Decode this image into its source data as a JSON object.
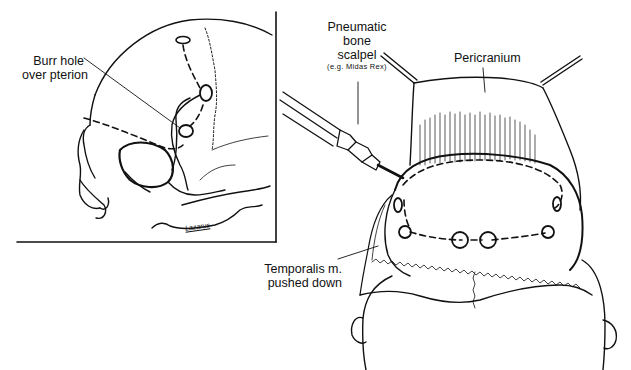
{
  "figure": {
    "left_panel": {
      "title": "Lateral skull view",
      "labels": {
        "burr_hole_line1": "Burr hole",
        "burr_hole_line2": "over pterion"
      },
      "signature": "Lazarus"
    },
    "right_panel": {
      "title": "Superior view of exposed cranium",
      "labels": {
        "scalpel_line1": "Pneumatic",
        "scalpel_line2": "bone",
        "scalpel_line3": "scalpel",
        "scalpel_example": "(e.g. Midas Rex)",
        "pericranium": "Pericranium",
        "temporalis_line1": "Temporalis m.",
        "temporalis_line2": "pushed down"
      },
      "burr_hole_count": 6
    },
    "colors": {
      "ink": "#111111",
      "background": "#ffffff"
    }
  }
}
